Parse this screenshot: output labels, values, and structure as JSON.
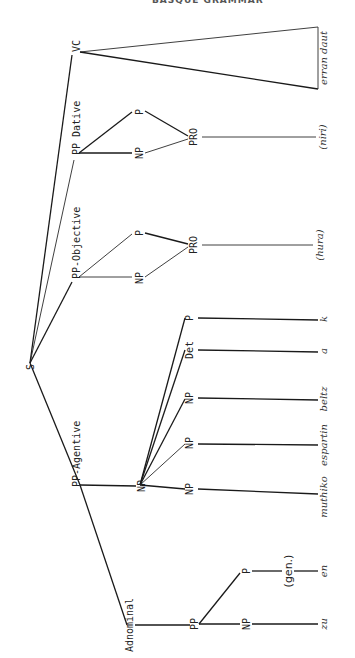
{
  "header": {
    "text": "BASQUE GRAMMAR"
  },
  "tree": {
    "root": "S",
    "nodes": {
      "s": "S",
      "vc": "VC",
      "pp_dative": "PP Dative",
      "pp_dative_p": "P",
      "pp_dative_np": "NP",
      "pp_dative_pro": "PRO",
      "pp_objective": "PP-Objective",
      "pp_objective_p": "P",
      "pp_objective_np": "NP",
      "pp_objective_pro": "PRO",
      "pp_agentive": "PP-Agentive",
      "agent_np": "NP",
      "agent_p": "P",
      "agent_det": "Det",
      "agent_np1": "NP",
      "agent_np2": "NP",
      "agent_np3": "NP",
      "adnominal": "Adnominal",
      "adn_pp": "PP",
      "adn_p": "P",
      "adn_np": "NP",
      "gen_note": "(gen.)"
    },
    "words": {
      "vc": "erran daut",
      "dative": "(niri)",
      "objective": "(hura)",
      "k": "k",
      "a": "a",
      "beltz": "beltz",
      "espartin": "espartin",
      "muthiko": "muthiko",
      "en": "en",
      "zu": "zu"
    }
  }
}
